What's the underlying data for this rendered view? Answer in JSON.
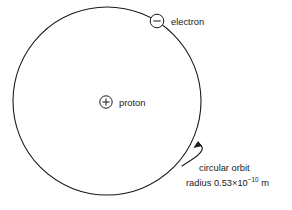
{
  "diagram": {
    "background_color": "#ffffff",
    "stroke_color": "#1a1a1a",
    "text_color": "#1a1a1a",
    "orbit": {
      "name": "circular-orbit",
      "center_x": 107,
      "center_y": 101,
      "radius": 94,
      "stroke_width": 1.1
    },
    "nucleus": {
      "symbol": "+",
      "label": "proton",
      "center_x": 106,
      "center_y": 102,
      "radius": 6.2
    },
    "electron": {
      "symbol": "−",
      "label": "electron",
      "center_x": 157,
      "center_y": 21,
      "radius": 6.8
    },
    "annotation": {
      "line1": "circular orbit",
      "line2_prefix": "radius 0.53×10",
      "line2_exponent": "−10",
      "line2_suffix": " m",
      "pointer_tip_x": 198,
      "pointer_tip_y": 142
    },
    "labels": {
      "electron_label_x": 172,
      "electron_label_y": 24,
      "proton_label_x": 119,
      "proton_label_y": 105,
      "annotation_line1_x": 199,
      "annotation_line1_y": 171,
      "annotation_line2_x": 186,
      "annotation_line2_y": 186
    }
  }
}
